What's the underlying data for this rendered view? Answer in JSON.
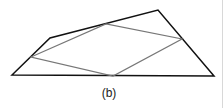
{
  "figure": {
    "caption": "(b)",
    "outer_quadrilateral": {
      "color": "#111111",
      "points": [
        [
          12,
          75
        ],
        [
          50,
          38
        ],
        [
          158,
          10
        ],
        [
          214,
          76
        ]
      ]
    },
    "inner_parallelogram": {
      "color": "#777777",
      "points": [
        [
          31,
          57
        ],
        [
          106,
          24
        ],
        [
          182,
          39
        ],
        [
          113,
          76
        ]
      ]
    }
  }
}
